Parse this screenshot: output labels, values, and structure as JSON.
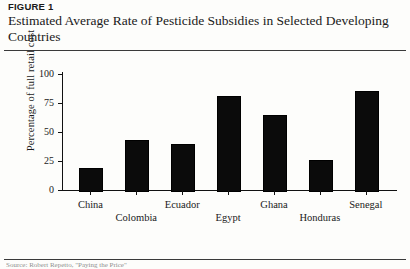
{
  "figure": {
    "label": "FIGURE 1",
    "title": "Estimated Average Rate of Pesticide Subsidies in Selected Developing Countries",
    "source": "Source: Robert Repetto, \"Paying the Price\""
  },
  "chart_data": {
    "type": "bar",
    "title": "Estimated Average Rate of Pesticide Subsidies in Selected Developing Countries",
    "xlabel": "",
    "ylabel": "Percentage of full retail cost",
    "categories": [
      "China",
      "Colombia",
      "Ecuador",
      "Egypt",
      "Ghana",
      "Honduras",
      "Senegal"
    ],
    "values": [
      19,
      43,
      40,
      81,
      65,
      26,
      85
    ],
    "ylim": [
      0,
      100
    ],
    "yticks": [
      0,
      25,
      50,
      75,
      100
    ],
    "ytick_labels": [
      "0",
      "25",
      "50",
      "75",
      "100"
    ],
    "grid": false,
    "legend": false,
    "bar_color": "#0b0b0b",
    "label_rows": [
      0,
      1,
      0,
      1,
      0,
      1,
      0
    ]
  }
}
